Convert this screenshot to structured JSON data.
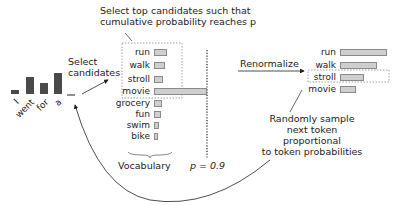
{
  "context": {
    "tokens": [
      "I",
      "went",
      "for",
      "a"
    ],
    "bar_heights": [
      4,
      17,
      11,
      21
    ],
    "blank": "_"
  },
  "labels": {
    "select_candidates": [
      "Select",
      "candidates"
    ],
    "top_p_caption": [
      "Select top candidates such that",
      "cumulative probability reaches p"
    ],
    "vocabulary": "Vocabulary",
    "p_value": "p = 0.9",
    "renormalize": "Renormalize",
    "sample_caption": [
      "Randomly sample",
      "next token",
      "proportional",
      "to token probabilities"
    ]
  },
  "vocabulary": {
    "items": [
      {
        "token": "run",
        "width": 13
      },
      {
        "token": "walk",
        "width": 11
      },
      {
        "token": "stroll",
        "width": 9
      },
      {
        "token": "movie",
        "width": 57
      },
      {
        "token": "grocery",
        "width": 8
      },
      {
        "token": "fun",
        "width": 7
      },
      {
        "token": "swim",
        "width": 5
      },
      {
        "token": "bike",
        "width": 4
      }
    ]
  },
  "renormalized": {
    "items": [
      {
        "token": "run",
        "width": 37
      },
      {
        "token": "walk",
        "width": 30
      },
      {
        "token": "stroll",
        "width": 20
      },
      {
        "token": "movie",
        "width": 14
      }
    ],
    "highlighted": "stroll"
  },
  "colors": {
    "context_bar": "#4a4a4a",
    "prob_bar_fill": "#cfcfcf",
    "prob_bar_border": "#8a8a8a",
    "text": "#222222"
  }
}
